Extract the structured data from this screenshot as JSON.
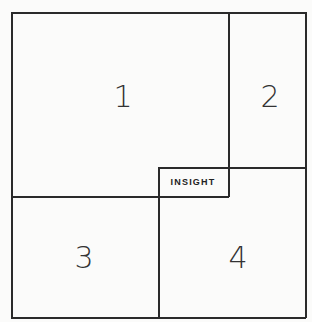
{
  "diagram": {
    "quadrants": [
      {
        "id": "1",
        "label": "1"
      },
      {
        "id": "2",
        "label": "2"
      },
      {
        "id": "3",
        "label": "3"
      },
      {
        "id": "4",
        "label": "4"
      }
    ],
    "center_label": "INSIGHT",
    "line_color": "#2a2a2a"
  }
}
